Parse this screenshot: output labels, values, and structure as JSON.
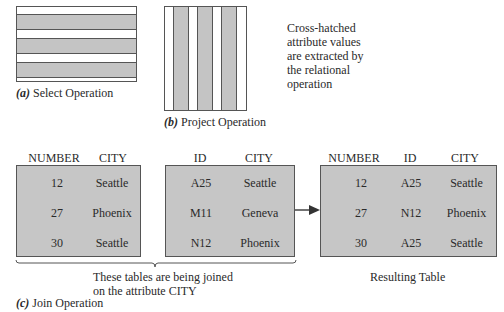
{
  "select": {
    "label_letter": "(a)",
    "label": "Select Operation",
    "selected_rows": [
      2,
      4,
      6
    ],
    "total_rows": 7
  },
  "project": {
    "label_letter": "(b)",
    "label": "Project Operation",
    "selected_cols": [
      2,
      4,
      6
    ],
    "total_cols": 7
  },
  "note": [
    "Cross-hatched",
    "attribute values",
    "are extracted by",
    "the relational",
    "operation"
  ],
  "join": {
    "label_letter": "(c)",
    "label": "Join Operation",
    "brace_note": [
      "These tables are being joined",
      "on the attribute CITY"
    ],
    "result_label": "Resulting Table",
    "table1": {
      "headers": [
        "NUMBER",
        "CITY"
      ],
      "rows": [
        [
          "12",
          "Seattle"
        ],
        [
          "27",
          "Phoenix"
        ],
        [
          "30",
          "Seattle"
        ]
      ]
    },
    "table2": {
      "headers": [
        "ID",
        "CITY"
      ],
      "rows": [
        [
          "A25",
          "Seattle"
        ],
        [
          "M11",
          "Geneva"
        ],
        [
          "N12",
          "Phoenix"
        ]
      ]
    },
    "result": {
      "headers": [
        "NUMBER",
        "ID",
        "CITY"
      ],
      "rows": [
        [
          "12",
          "A25",
          "Seattle"
        ],
        [
          "27",
          "N12",
          "Phoenix"
        ],
        [
          "30",
          "A25",
          "Seattle"
        ]
      ]
    }
  }
}
